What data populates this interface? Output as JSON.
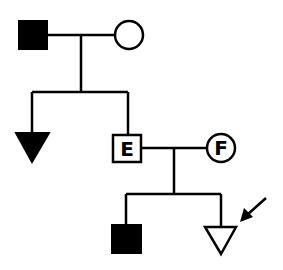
{
  "diagram": {
    "type": "pedigree",
    "colors": {
      "stroke": "#000000",
      "affected": "#000000",
      "unaffected": "#ffffff"
    },
    "generation1": {
      "father": {
        "shape": "square",
        "affected": true
      },
      "mother": {
        "shape": "circle",
        "affected": false
      }
    },
    "generation2": {
      "child1": {
        "shape": "triangle",
        "affected": true,
        "label": ""
      },
      "child2": {
        "shape": "square",
        "affected": false,
        "label": "E"
      },
      "spouse": {
        "shape": "circle",
        "affected": false,
        "label": "F"
      }
    },
    "generation3": {
      "child1": {
        "shape": "square",
        "affected": true
      },
      "child2": {
        "shape": "triangle",
        "affected": false,
        "proband": true
      }
    },
    "proband_arrow": "arrow-icon"
  }
}
